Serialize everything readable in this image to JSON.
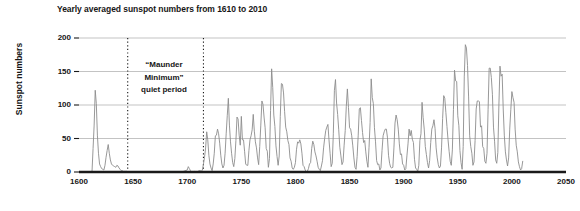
{
  "chart_data": {
    "type": "line",
    "title": "Yearly averaged sunspot numbers from 1610 to 2010",
    "xlabel": "",
    "ylabel": "Sunspot numbers",
    "xlim": [
      1600,
      2050
    ],
    "ylim": [
      0,
      200
    ],
    "grid": true,
    "legend": "none",
    "xticks": [
      "1600",
      "1650",
      "1700",
      "1750",
      "1800",
      "1850",
      "1900",
      "1950",
      "2000",
      "2050"
    ],
    "yticks": [
      "0",
      "50",
      "100",
      "150",
      "200"
    ],
    "series": [
      {
        "name": "Yearly averaged sunspot number",
        "color": "#8c8c8c",
        "x": [
          1610,
          1611,
          1612,
          1613,
          1614,
          1615,
          1616,
          1617,
          1618,
          1619,
          1620,
          1621,
          1622,
          1623,
          1624,
          1625,
          1626,
          1627,
          1628,
          1629,
          1630,
          1631,
          1632,
          1633,
          1634,
          1635,
          1636,
          1637,
          1638,
          1639,
          1640,
          1641,
          1642,
          1643,
          1644,
          1645,
          1646,
          1647,
          1648,
          1649,
          1650,
          1655,
          1660,
          1665,
          1670,
          1675,
          1680,
          1685,
          1690,
          1695,
          1700,
          1701,
          1702,
          1703,
          1704,
          1705,
          1706,
          1707,
          1708,
          1709,
          1710,
          1711,
          1712,
          1713,
          1714,
          1715,
          1716,
          1717,
          1718,
          1719,
          1720,
          1721,
          1722,
          1723,
          1724,
          1725,
          1726,
          1727,
          1728,
          1729,
          1730,
          1731,
          1732,
          1733,
          1734,
          1735,
          1736,
          1737,
          1738,
          1739,
          1740,
          1741,
          1742,
          1743,
          1744,
          1745,
          1746,
          1747,
          1748,
          1749,
          1750,
          1751,
          1752,
          1753,
          1754,
          1755,
          1756,
          1757,
          1758,
          1759,
          1760,
          1761,
          1762,
          1763,
          1764,
          1765,
          1766,
          1767,
          1768,
          1769,
          1770,
          1771,
          1772,
          1773,
          1774,
          1775,
          1776,
          1777,
          1778,
          1779,
          1780,
          1781,
          1782,
          1783,
          1784,
          1785,
          1786,
          1787,
          1788,
          1789,
          1790,
          1791,
          1792,
          1793,
          1794,
          1795,
          1796,
          1797,
          1798,
          1799,
          1800,
          1801,
          1802,
          1803,
          1804,
          1805,
          1806,
          1807,
          1808,
          1809,
          1810,
          1811,
          1812,
          1813,
          1814,
          1815,
          1816,
          1817,
          1818,
          1819,
          1820,
          1821,
          1822,
          1823,
          1824,
          1825,
          1826,
          1827,
          1828,
          1829,
          1830,
          1831,
          1832,
          1833,
          1834,
          1835,
          1836,
          1837,
          1838,
          1839,
          1840,
          1841,
          1842,
          1843,
          1844,
          1845,
          1846,
          1847,
          1848,
          1849,
          1850,
          1851,
          1852,
          1853,
          1854,
          1855,
          1856,
          1857,
          1858,
          1859,
          1860,
          1861,
          1862,
          1863,
          1864,
          1865,
          1866,
          1867,
          1868,
          1869,
          1870,
          1871,
          1872,
          1873,
          1874,
          1875,
          1876,
          1877,
          1878,
          1879,
          1880,
          1881,
          1882,
          1883,
          1884,
          1885,
          1886,
          1887,
          1888,
          1889,
          1890,
          1891,
          1892,
          1893,
          1894,
          1895,
          1896,
          1897,
          1898,
          1899,
          1900,
          1901,
          1902,
          1903,
          1904,
          1905,
          1906,
          1907,
          1908,
          1909,
          1910,
          1911,
          1912,
          1913,
          1914,
          1915,
          1916,
          1917,
          1918,
          1919,
          1920,
          1921,
          1922,
          1923,
          1924,
          1925,
          1926,
          1927,
          1928,
          1929,
          1930,
          1931,
          1932,
          1933,
          1934,
          1935,
          1936,
          1937,
          1938,
          1939,
          1940,
          1941,
          1942,
          1943,
          1944,
          1945,
          1946,
          1947,
          1948,
          1949,
          1950,
          1951,
          1952,
          1953,
          1954,
          1955,
          1956,
          1957,
          1958,
          1959,
          1960,
          1961,
          1962,
          1963,
          1964,
          1965,
          1966,
          1967,
          1968,
          1969,
          1970,
          1971,
          1972,
          1973,
          1974,
          1975,
          1976,
          1977,
          1978,
          1979,
          1980,
          1981,
          1982,
          1983,
          1984,
          1985,
          1986,
          1987,
          1988,
          1989,
          1990,
          1991,
          1992,
          1993,
          1994,
          1995,
          1996,
          1997,
          1998,
          1999,
          2000,
          2001,
          2002,
          2003,
          2004,
          2005,
          2006,
          2007,
          2008,
          2009,
          2010
        ],
        "y": [
          0,
          0,
          0,
          35,
          70,
          122,
          102,
          55,
          28,
          12,
          8,
          5,
          4,
          3,
          10,
          22,
          32,
          41,
          28,
          18,
          12,
          10,
          9,
          8,
          7,
          10,
          9,
          6,
          4,
          2,
          2,
          1,
          1,
          1,
          1,
          0,
          0,
          0,
          0,
          0,
          0,
          0,
          0,
          0,
          0,
          0,
          0,
          0,
          0,
          0,
          3,
          8,
          5,
          2,
          0,
          0,
          0,
          1,
          0,
          0,
          1,
          2,
          2,
          1,
          3,
          12,
          22,
          36,
          60,
          48,
          25,
          12,
          6,
          2,
          12,
          28,
          54,
          55,
          64,
          57,
          43,
          25,
          12,
          6,
          10,
          28,
          57,
          84,
          110,
          70,
          45,
          28,
          14,
          8,
          20,
          47,
          82,
          79,
          55,
          40,
          83,
          48,
          48,
          31,
          12,
          10,
          10,
          32,
          48,
          54,
          63,
          86,
          61,
          45,
          36,
          21,
          11,
          38,
          70,
          106,
          101,
          82,
          66,
          35,
          31,
          7,
          20,
          92,
          154,
          126,
          85,
          68,
          39,
          23,
          10,
          24,
          83,
          132,
          131,
          118,
          90,
          67,
          60,
          47,
          41,
          21,
          16,
          6,
          4,
          7,
          14,
          34,
          45,
          43,
          48,
          42,
          28,
          10,
          8,
          3,
          0,
          1,
          5,
          12,
          14,
          35,
          46,
          41,
          30,
          24,
          16,
          7,
          4,
          2,
          9,
          17,
          36,
          50,
          62,
          67,
          71,
          48,
          28,
          8,
          13,
          57,
          122,
          138,
          103,
          86,
          63,
          37,
          24,
          11,
          15,
          40,
          62,
          98,
          124,
          96,
          66,
          64,
          54,
          39,
          21,
          7,
          4,
          23,
          55,
          94,
          96,
          77,
          59,
          44,
          47,
          30,
          16,
          7,
          37,
          74,
          139,
          111,
          102,
          66,
          45,
          17,
          11,
          12,
          3,
          6,
          32,
          54,
          60,
          64,
          64,
          52,
          25,
          13,
          7,
          6,
          7,
          36,
          73,
          85,
          78,
          64,
          42,
          26,
          27,
          12,
          10,
          3,
          5,
          24,
          42,
          64,
          54,
          62,
          49,
          44,
          19,
          6,
          4,
          1,
          10,
          47,
          57,
          104,
          81,
          64,
          38,
          26,
          14,
          6,
          17,
          44,
          64,
          69,
          78,
          65,
          36,
          21,
          11,
          6,
          9,
          36,
          80,
          114,
          110,
          89,
          68,
          48,
          31,
          16,
          10,
          33,
          93,
          152,
          136,
          135,
          84,
          69,
          32,
          14,
          4,
          38,
          142,
          190,
          185,
          159,
          112,
          54,
          38,
          28,
          10,
          15,
          47,
          94,
          106,
          106,
          105,
          67,
          69,
          38,
          35,
          16,
          13,
          28,
          93,
          155,
          155,
          141,
          116,
          67,
          46,
          18,
          13,
          29,
          100,
          158,
          143,
          146,
          94,
          55,
          30,
          18,
          9,
          21,
          64,
          93,
          120,
          111,
          104,
          64,
          40,
          30,
          15,
          8,
          3,
          5,
          16
        ]
      }
    ],
    "annotations": [
      {
        "name": "maunder-minimum",
        "lines": [
          "“Maunder",
          "Minimum”",
          "quiet period"
        ],
        "x_start": 1645,
        "x_end": 1715,
        "marker_style": "dotted-vertical-lines"
      }
    ],
    "colors": {
      "line": "#8c8c8c",
      "gridline": "#b4b4b4",
      "axis": "#1a1a1a",
      "dotted_marker": "#1a1a1a",
      "background": "#ffffff",
      "text": "#161616"
    }
  }
}
